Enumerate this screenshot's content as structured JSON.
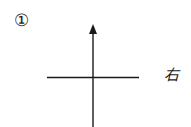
{
  "figure": {
    "number_label": "①",
    "direction_label": "右",
    "line_color": "#1a1a1a"
  }
}
